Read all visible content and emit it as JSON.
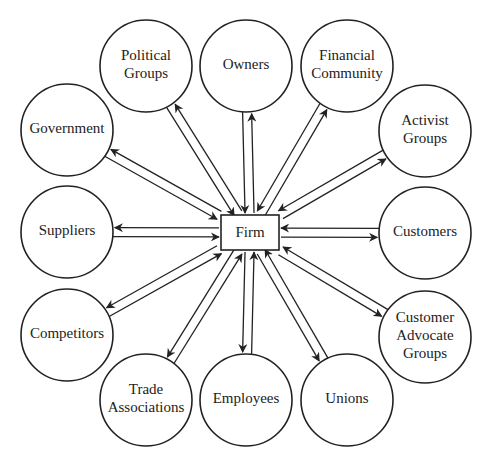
{
  "diagram": {
    "center": {
      "label": "Firm",
      "box": {
        "x": 221,
        "y": 215,
        "w": 58,
        "h": 35
      }
    },
    "node_radius": 46,
    "stroke_color": "#222222",
    "background": "#ffffff",
    "nodes": [
      {
        "id": "political-groups",
        "lines": [
          "Political",
          "Groups"
        ],
        "cx": 146,
        "cy": 66
      },
      {
        "id": "owners",
        "lines": [
          "Owners"
        ],
        "cx": 246,
        "cy": 66
      },
      {
        "id": "financial-community",
        "lines": [
          "Financial",
          "Community"
        ],
        "cx": 347,
        "cy": 66
      },
      {
        "id": "government",
        "lines": [
          "Government"
        ],
        "cx": 67,
        "cy": 130
      },
      {
        "id": "activist-groups",
        "lines": [
          "Activist",
          "Groups"
        ],
        "cx": 425,
        "cy": 131
      },
      {
        "id": "suppliers",
        "lines": [
          "Suppliers"
        ],
        "cx": 67,
        "cy": 232
      },
      {
        "id": "customers",
        "lines": [
          "Customers"
        ],
        "cx": 425,
        "cy": 233
      },
      {
        "id": "competitors",
        "lines": [
          "Competitors"
        ],
        "cx": 67,
        "cy": 335
      },
      {
        "id": "customer-advocate-groups",
        "lines": [
          "Customer",
          "Advocate",
          "Groups"
        ],
        "cx": 425,
        "cy": 337
      },
      {
        "id": "trade-associations",
        "lines": [
          "Trade",
          "Associations"
        ],
        "cx": 146,
        "cy": 400
      },
      {
        "id": "employees",
        "lines": [
          "Employees"
        ],
        "cx": 246,
        "cy": 400
      },
      {
        "id": "unions",
        "lines": [
          "Unions"
        ],
        "cx": 347,
        "cy": 400
      }
    ],
    "connection_style": "bidirectional-parallel-arrows"
  }
}
